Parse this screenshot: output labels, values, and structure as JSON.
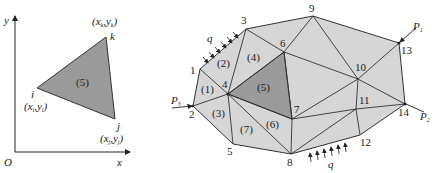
{
  "colors": {
    "element_fill": "#d6d6d6",
    "highlight_fill": "#9a9a9a",
    "stroke": "#333333",
    "background": "#ffffff"
  },
  "left_figure": {
    "axis_x_label": "x",
    "axis_y_label": "y",
    "origin_label": "O",
    "element_label": "(5)",
    "nodes": {
      "i": {
        "label": "i",
        "coord_label": "(x",
        "sub": "i",
        "mid": ",y",
        "sub2": "i",
        "end": ")"
      },
      "j": {
        "label": "j",
        "coord_label": "(x",
        "sub": "j",
        "mid": ",y",
        "sub2": "j",
        "end": ")"
      },
      "k": {
        "label": "k",
        "coord_label": "(x",
        "sub": "k",
        "mid": ",y",
        "sub2": "k",
        "end": ")"
      }
    }
  },
  "right_figure": {
    "node_labels": [
      "1",
      "2",
      "3",
      "4",
      "5",
      "6",
      "7",
      "8",
      "9",
      "10",
      "11",
      "12",
      "13",
      "14"
    ],
    "element_labels": [
      "(1)",
      "(2)",
      "(3)",
      "(4)",
      "(5)",
      "(6)",
      "(7)"
    ],
    "loads": {
      "p1": {
        "label": "P",
        "sub": "1"
      },
      "p2": {
        "label": "P",
        "sub": "2"
      },
      "p3": {
        "label": "P",
        "sub": "3"
      },
      "q_top": "q",
      "q_bottom": "q"
    }
  }
}
